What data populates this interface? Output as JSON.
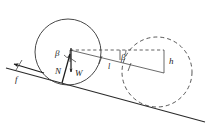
{
  "figure": {
    "kind": "free-body-diagram",
    "background_color": "#ffffff",
    "line_color": "#333333"
  },
  "labels": {
    "beta_left": "β",
    "beta_right": "β",
    "normal_force": "N",
    "weight": "W",
    "friction": "f",
    "length_l": "l",
    "height_h": "h"
  },
  "elements": {
    "solid_circle_name": "wheel-initial-position",
    "dashed_circle_name": "wheel-final-position",
    "incline_name": "inclined-plane-surface",
    "horizontal_dashed_name": "horizontal-reference-line",
    "connector_name": "displacement-connector",
    "vector_n_name": "normal-force-vector",
    "vector_w_name": "weight-force-vector",
    "vector_f_name": "friction-force-vector"
  },
  "geometry": {
    "solid_circle": {
      "cx": 68,
      "cy": 52,
      "r": 33
    },
    "dashed_circle": {
      "cx": 157,
      "cy": 72,
      "r": 35
    },
    "incline_start": {
      "x": 6,
      "y": 68
    },
    "incline_end": {
      "x": 205,
      "y": 122
    },
    "contact_point": {
      "x": 62,
      "y": 83
    },
    "hub_point": {
      "x": 70,
      "y": 50
    },
    "dashed_line_y": 50,
    "h_top": {
      "x": 164,
      "y": 50
    },
    "h_bottom": {
      "x": 164,
      "y": 73
    }
  }
}
